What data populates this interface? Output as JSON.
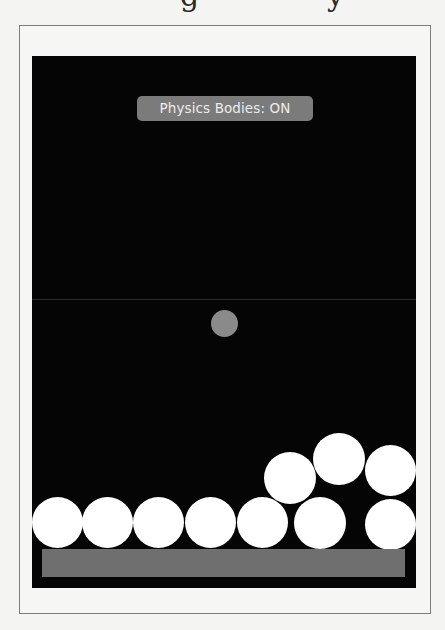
{
  "page": {
    "heading_fragment": {
      "glyphs": [
        {
          "char": "g",
          "x": 180
        },
        {
          "char": "y",
          "x": 327
        }
      ]
    }
  },
  "scene": {
    "background": "#050505",
    "origin": {
      "x": 32,
      "y": 56
    },
    "midline_y": 243,
    "toggle_label": {
      "text": "Physics Bodies: ON",
      "x": 105,
      "y": 40,
      "width": 176,
      "background": "#7b7b7b",
      "color": "#ececec"
    },
    "dynamic_ball": {
      "cx": 192,
      "cy": 267,
      "r": 13.5,
      "color": "#8a8a8a"
    },
    "balls": [
      {
        "cx": 25,
        "cy": 466,
        "r": 25.5,
        "color": "#ffffff"
      },
      {
        "cx": 75,
        "cy": 466,
        "r": 25.5,
        "color": "#ffffff"
      },
      {
        "cx": 126,
        "cy": 466,
        "r": 25.5,
        "color": "#ffffff"
      },
      {
        "cx": 178,
        "cy": 466,
        "r": 25.5,
        "color": "#ffffff"
      },
      {
        "cx": 230,
        "cy": 466,
        "r": 25.5,
        "color": "#ffffff"
      },
      {
        "cx": 288,
        "cy": 467,
        "r": 26,
        "color": "#ffffff"
      },
      {
        "cx": 358,
        "cy": 468,
        "r": 25.5,
        "color": "#ffffff"
      },
      {
        "cx": 258,
        "cy": 422,
        "r": 26,
        "color": "#ffffff"
      },
      {
        "cx": 307,
        "cy": 403,
        "r": 26,
        "color": "#ffffff"
      },
      {
        "cx": 358,
        "cy": 414,
        "r": 25.5,
        "color": "#ffffff"
      }
    ],
    "ground": {
      "x": 10,
      "y": 493,
      "width": 363,
      "height": 28,
      "color": "#6f6f6f"
    }
  }
}
